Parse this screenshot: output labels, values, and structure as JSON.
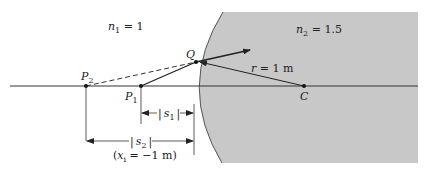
{
  "diagram": {
    "medium1": {
      "symbol": "n",
      "sub": "1",
      "rest": " = 1"
    },
    "medium2": {
      "symbol": "n",
      "sub": "2",
      "rest": " = 1.5"
    },
    "radius": {
      "symbol": "r",
      "rest": " = 1 m"
    },
    "points": {
      "Q": "Q",
      "C": "C",
      "P1": {
        "symbol": "P",
        "sub": "1"
      },
      "P2": {
        "symbol": "P",
        "sub": "2"
      }
    },
    "dimensions": {
      "s1": {
        "bar_left": "|",
        "symbol": "s",
        "sub": "1",
        "bar_right": "|"
      },
      "s2": {
        "bar_left": "|",
        "symbol": "s",
        "sub": "2",
        "bar_right": "|"
      },
      "xi_note": {
        "open": "(",
        "symbol": "x",
        "sub": "i",
        "rest": " = −1 m)"
      }
    },
    "colors": {
      "medium2_fill": "#c8c8c8",
      "line": "#222222",
      "background": "#ffffff"
    }
  }
}
